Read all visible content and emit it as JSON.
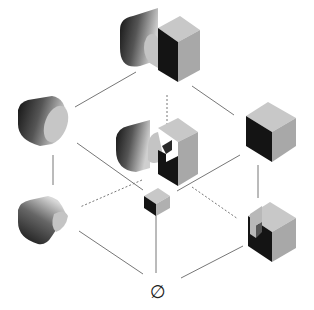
{
  "diagram": {
    "type": "lattice",
    "colors": {
      "background": "#ffffff",
      "edge": "#777777",
      "face_light": "#c8c8c8",
      "face_mid": "#a8a8a8",
      "face_dark": "#141414"
    },
    "nodes": [
      {
        "id": "top",
        "label": "cylinder-union-cube",
        "x": 160,
        "y": 40
      },
      {
        "id": "left-mid",
        "label": "cylinder",
        "x": 42,
        "y": 120
      },
      {
        "id": "center",
        "label": "cylinder-cube-notched",
        "x": 158,
        "y": 150
      },
      {
        "id": "right-mid",
        "label": "cube",
        "x": 272,
        "y": 122
      },
      {
        "id": "left-low",
        "label": "cylinder-cut",
        "x": 42,
        "y": 214
      },
      {
        "id": "center-low",
        "label": "small-cube",
        "x": 156,
        "y": 202
      },
      {
        "id": "right-low",
        "label": "cube-notched",
        "x": 272,
        "y": 230
      },
      {
        "id": "bottom",
        "label": "∅",
        "x": 157,
        "y": 290
      }
    ],
    "edges": [
      {
        "from": "top",
        "to": "left-mid",
        "style": "solid"
      },
      {
        "from": "top",
        "to": "right-mid",
        "style": "solid"
      },
      {
        "from": "top",
        "to": "center",
        "style": "dashed"
      },
      {
        "from": "left-mid",
        "to": "center-low",
        "style": "solid"
      },
      {
        "from": "left-mid",
        "to": "left-low",
        "style": "solid"
      },
      {
        "from": "right-mid",
        "to": "center-low",
        "style": "solid"
      },
      {
        "from": "right-mid",
        "to": "right-low",
        "style": "solid"
      },
      {
        "from": "center",
        "to": "left-low",
        "style": "dashed"
      },
      {
        "from": "center",
        "to": "right-low",
        "style": "dashed"
      },
      {
        "from": "center-low",
        "to": "bottom",
        "style": "solid"
      },
      {
        "from": "left-low",
        "to": "bottom",
        "style": "solid"
      },
      {
        "from": "right-low",
        "to": "bottom",
        "style": "solid"
      }
    ],
    "empty_set_label": "∅"
  }
}
